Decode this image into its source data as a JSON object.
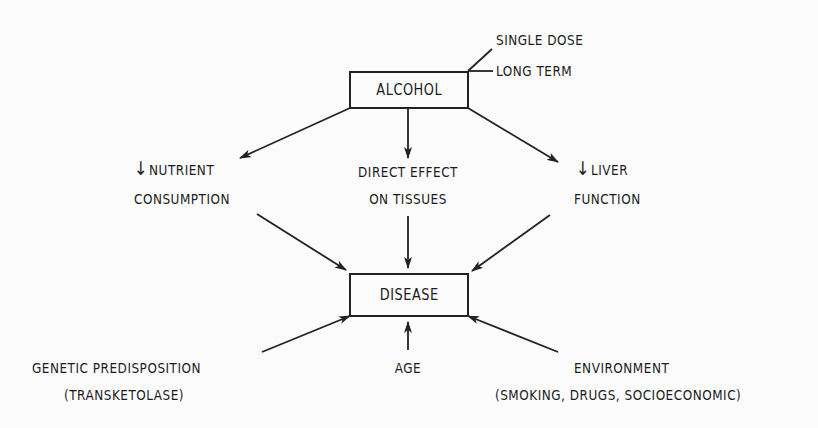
{
  "diagram": {
    "type": "flow-diagram",
    "nodes": {
      "alcohol": {
        "label": "ALCOHOL"
      },
      "disease": {
        "label": "DISEASE"
      }
    },
    "alcohol_modifiers": [
      "SINGLE DOSE",
      "LONG TERM"
    ],
    "intermediate_effects": {
      "nutrient": {
        "arrow_symbol": "↓",
        "line1": "NUTRIENT",
        "line2": "CONSUMPTION"
      },
      "direct": {
        "line1": "DIRECT EFFECT",
        "line2": "ON TISSUES"
      },
      "liver": {
        "arrow_symbol": "↓",
        "line1": "LIVER",
        "line2": "FUNCTION"
      }
    },
    "contributing_factors": {
      "genetic": {
        "line1": "GENETIC PREDISPOSITION",
        "line2": "(TRANSKETOLASE)"
      },
      "age": {
        "line1": "AGE"
      },
      "environment": {
        "line1": "ENVIRONMENT",
        "line2": "(SMOKING, DRUGS, SOCIOECONOMIC)"
      }
    },
    "edges": [
      {
        "from": "alcohol",
        "to": "nutrient"
      },
      {
        "from": "alcohol",
        "to": "direct"
      },
      {
        "from": "alcohol",
        "to": "liver"
      },
      {
        "from": "nutrient",
        "to": "disease"
      },
      {
        "from": "direct",
        "to": "disease"
      },
      {
        "from": "liver",
        "to": "disease"
      },
      {
        "from": "genetic",
        "to": "disease"
      },
      {
        "from": "age",
        "to": "disease"
      },
      {
        "from": "environment",
        "to": "disease"
      }
    ],
    "colors": {
      "ink": "#1c1c1c",
      "background": "#fbfbfb"
    }
  }
}
